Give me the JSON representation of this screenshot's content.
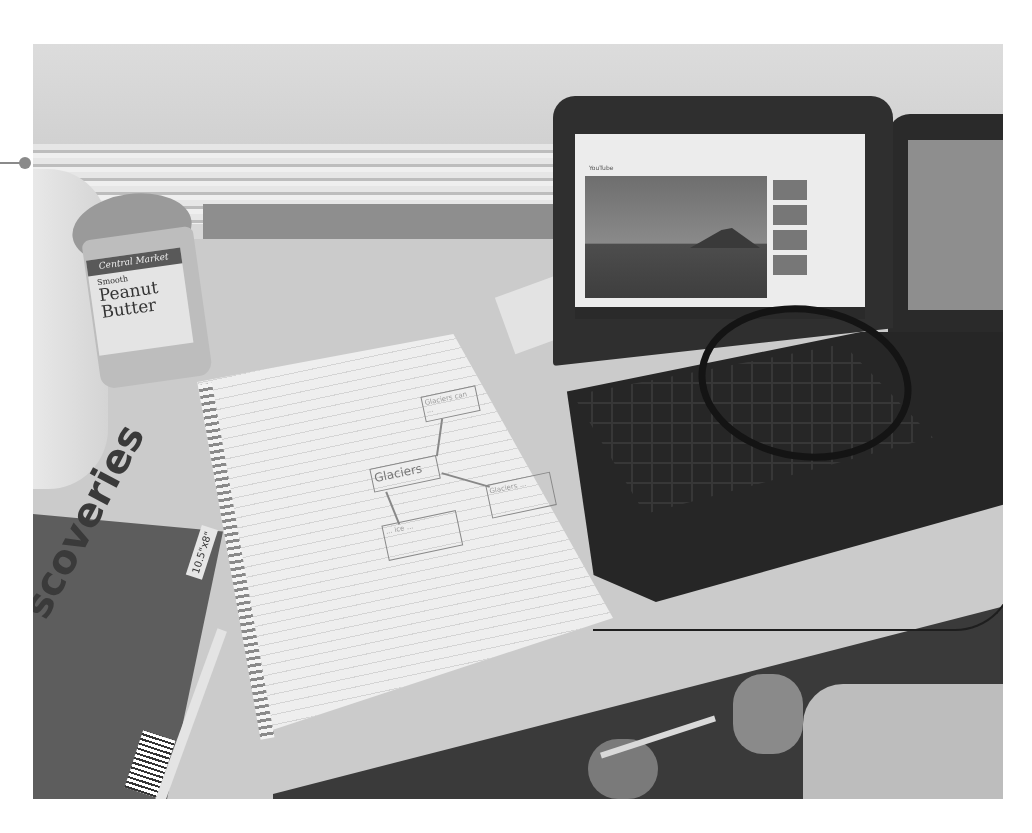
{
  "image": {
    "type": "photograph",
    "color_mode": "grayscale",
    "scene": "student desk with laptop showing video, spiral notebook with concept map, peanut butter jar, headphones"
  },
  "callout": {
    "marker": "dot-with-line",
    "color": "#8a8a8a"
  },
  "objects": {
    "jar": {
      "brand": "Central Market",
      "variety": "Smooth",
      "product_line1": "Peanut",
      "product_line2": "Butter"
    },
    "notebook": {
      "concept_map": {
        "center": "Glaciers",
        "branches": [
          "Glaciers can ...",
          "Glaciers ...",
          "... ice ..."
        ]
      }
    },
    "book": {
      "title_fragment": "scoveries",
      "size_label": "10.5\"x8\""
    },
    "laptop": {
      "screen_site": "YouTube",
      "video_subject": "mountains and lake landscape"
    }
  },
  "colors": {
    "background": "#ffffff",
    "desk": "#cbcbcb",
    "laptop": "#2f2f2f",
    "paper": "#eeeeee"
  }
}
